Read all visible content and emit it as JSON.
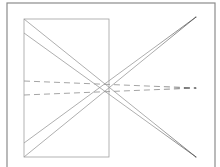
{
  "diagram": {
    "type": "perspective-line-drawing",
    "background": "#ffffff",
    "stroke_color": "#9a9a9a",
    "dark_stroke_color": "#555555",
    "outer_frame": {
      "x": 7,
      "y": 3,
      "width": 208,
      "height": 170,
      "stroke": "#8c8c8c"
    },
    "inner_rectangle": {
      "x": 24,
      "y": 19,
      "width": 85,
      "height": 138,
      "stroke": "#a0a0a0"
    },
    "solid_lines": [
      {
        "id": "diag-down-1",
        "x1": 24,
        "y1": 19,
        "x2": 196,
        "y2": 157
      },
      {
        "id": "diag-down-2",
        "x1": 24,
        "y1": 33,
        "x2": 196,
        "y2": 157
      },
      {
        "id": "diag-up-1",
        "x1": 24,
        "y1": 157,
        "x2": 196,
        "y2": 17
      },
      {
        "id": "diag-up-2",
        "x1": 24,
        "y1": 143,
        "x2": 196,
        "y2": 17
      }
    ],
    "dashed_lines": [
      {
        "id": "dash-1",
        "x1": 24,
        "y1": 81,
        "x2": 196,
        "y2": 88
      },
      {
        "id": "dash-2",
        "x1": 24,
        "y1": 95,
        "x2": 196,
        "y2": 88
      }
    ],
    "vanishing_points": [
      {
        "id": "vp-top-right",
        "x": 196,
        "y": 17
      },
      {
        "id": "vp-bottom-right",
        "x": 196,
        "y": 157
      },
      {
        "id": "vp-middle-right",
        "x": 196,
        "y": 88
      }
    ]
  }
}
